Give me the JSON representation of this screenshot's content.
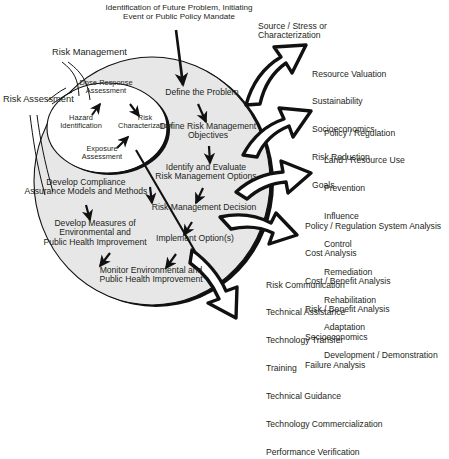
{
  "diagram": {
    "title_note": "Risk Management / Risk Assessment cycle diagram",
    "top_label": "Identification of Future Problem, Initiating\nEvent or Public Policy Mandate",
    "outer_ring_label": "Risk Management",
    "inner_ring_label": "Risk Assessment",
    "colors": {
      "outer_fill": "#e7e7e7",
      "inner_fill": "#ffffff",
      "stroke": "#111111",
      "text": "#231f20",
      "arrow_fill": "#ffffff"
    },
    "outer_steps": [
      {
        "id": "define-the-problem",
        "text": "Define the Problem"
      },
      {
        "id": "define-risk-management-objectives",
        "text": "Define Risk Management\nObjectives"
      },
      {
        "id": "identify-and-evaluate-risk-management-options",
        "text": "Identify and Evaluate\nRisk Management Options"
      },
      {
        "id": "risk-management-decision",
        "text": "Risk Management Decision"
      },
      {
        "id": "implement-options",
        "text": "Implement Option(s)"
      },
      {
        "id": "monitor-environmental-and-public-health-improvement",
        "text": "Monitor Environmental and\nPublic Health Improvement"
      },
      {
        "id": "develop-measures-of-environmental-and-public-health-improvement",
        "text": "Develop Measures of\nEnvironmental and\nPublic Health Improvement"
      },
      {
        "id": "develop-compliance-assurance-models-and-methods",
        "text": "Develop Compliance\nAssurance Models and Methods"
      }
    ],
    "inner_steps": [
      {
        "id": "hazard-identification",
        "text": "Hazard\nIdentification"
      },
      {
        "id": "dose-response-assessment",
        "text": "Dose-Response\nAssessment"
      },
      {
        "id": "risk-characterization",
        "text": "Risk\nCharacterization"
      },
      {
        "id": "exposure-assessment",
        "text": "Exposure\nAssessment"
      }
    ],
    "callouts": [
      {
        "id": "source-stress-or-characterization",
        "heading": "Source / Stress or\nCharacterization",
        "items": []
      },
      {
        "id": "resource-valuation-group",
        "heading": "",
        "items": [
          "Resource Valuation",
          "Sustainability",
          "Socioeconomics",
          "Risk Reduction",
          "Goals"
        ]
      },
      {
        "id": "policy-regulation-group",
        "heading": "",
        "items": [
          "Policy / Regulation",
          "Land / Resource Use",
          "Prevention",
          "Influence",
          "Control",
          "Remediation",
          "Rehabilitation",
          "Adaptation",
          "Development / Demonstration"
        ]
      },
      {
        "id": "analysis-group",
        "heading": "",
        "items": [
          "Policy / Regulation System Analysis",
          "Cost Analysis",
          "Cost / Benefit Analysis",
          "Risk / Benefit Analysis",
          "Socioeconomics",
          "Failure Analysis"
        ]
      },
      {
        "id": "communication-group",
        "heading": "",
        "items": [
          "Risk Communication",
          "Technical Assistance",
          "Technology Transfer",
          "Training",
          "Technical Guidance",
          "Technology Commercialization",
          "Performance Verification"
        ]
      }
    ]
  }
}
